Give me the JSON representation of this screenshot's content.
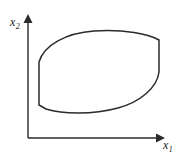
{
  "figure": {
    "background_color": "#ffffff",
    "ink_color": "#2b2b2b",
    "axes": {
      "x_axis": {
        "label": "x",
        "label_subscript": "1",
        "name": "x1",
        "orientation": "horizontal",
        "arrow": "right-arrow-icon",
        "origin_px": [
          28,
          138
        ],
        "end_px": [
          163,
          138
        ]
      },
      "y_axis": {
        "label": "x",
        "label_subscript": "2",
        "name": "x2",
        "orientation": "vertical",
        "arrow": "up-arrow-icon",
        "origin_px": [
          28,
          138
        ],
        "end_px": [
          28,
          15
        ]
      }
    },
    "region": {
      "name": "convex-region",
      "description": "closed convex set with flat vertical left and right edges",
      "fill_color": "#ffffff",
      "stroke_color": "#2b2b2b",
      "stroke_width": 1.5,
      "vertices_px": {
        "left_edge_top": [
          39,
          62
        ],
        "left_edge_bottom": [
          39,
          105
        ],
        "right_edge_top": [
          159,
          40
        ],
        "right_edge_bottom": [
          159,
          72
        ]
      },
      "path": "M 39 62 C 44 45 66 33 94 31 C 124 29 149 34 159 40 L 159 72 C 157 88 140 102 118 108 C 92 115 62 114 46 109 L 39 105 Z"
    }
  }
}
